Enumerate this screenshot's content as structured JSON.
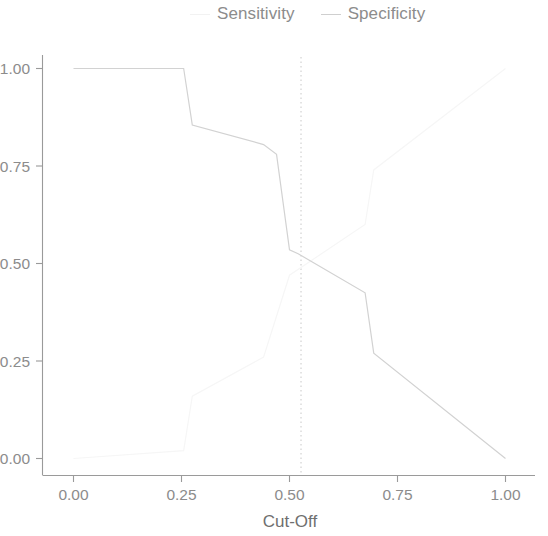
{
  "legend": {
    "position": "top",
    "entries": [
      {
        "label": "Sensitivity",
        "color": "#f2f2f2",
        "marker": "line-dash"
      },
      {
        "label": "Specificity",
        "color": "#cfcfcf",
        "marker": "line-dash"
      }
    ]
  },
  "chart_data": {
    "type": "line",
    "title": "",
    "subtitle": "",
    "xlabel": "Cut-Off",
    "ylabel": "",
    "xlim": [
      0.0,
      1.0
    ],
    "ylim": [
      0.0,
      1.0
    ],
    "grid": false,
    "legend_position": "top",
    "xticks": [
      "0.00",
      "0.25",
      "0.50",
      "0.75",
      "1.00"
    ],
    "xtick_values": [
      0.0,
      0.25,
      0.5,
      0.75,
      1.0
    ],
    "yticks": [
      "1.00",
      "0.75",
      "0.50",
      "0.25",
      "0.00"
    ],
    "ytick_values": [
      1.0,
      0.75,
      0.5,
      0.25,
      0.0
    ],
    "annotations": [
      {
        "type": "vertical-reference-line",
        "x": 0.5,
        "style": "dotted",
        "color": "#c8c8c8"
      }
    ],
    "series": [
      {
        "name": "Specificity",
        "color": "#d2d2d2",
        "x": [
          0.0,
          0.255,
          0.275,
          0.44,
          0.47,
          0.5,
          0.52,
          0.675,
          0.695,
          1.0
        ],
        "values": [
          1.0,
          1.0,
          0.855,
          0.805,
          0.78,
          0.535,
          0.525,
          0.425,
          0.27,
          0.0
        ]
      },
      {
        "name": "Sensitivity",
        "color": "#f6f6f6",
        "x": [
          0.0,
          0.255,
          0.275,
          0.44,
          0.5,
          0.675,
          0.695,
          1.0
        ],
        "values": [
          0.0,
          0.02,
          0.16,
          0.26,
          0.47,
          0.6,
          0.74,
          1.0
        ]
      }
    ]
  }
}
